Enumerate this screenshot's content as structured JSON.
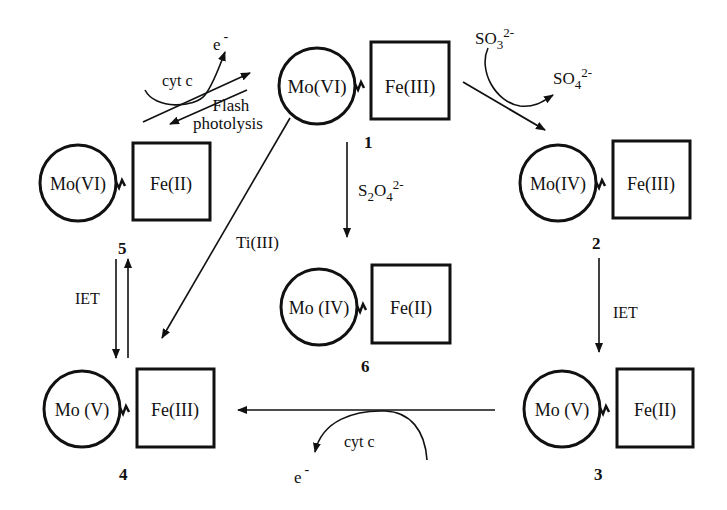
{
  "species": [
    {
      "id": "1",
      "mo": "Mo(VI)",
      "fe": "Fe(III)",
      "number": "1"
    },
    {
      "id": "2",
      "mo": "Mo(IV)",
      "fe": "Fe(III)",
      "number": "2"
    },
    {
      "id": "3",
      "mo": "Mo (V)",
      "fe": "Fe(II)",
      "number": "3"
    },
    {
      "id": "4",
      "mo": "Mo (V)",
      "fe": "Fe(III)",
      "number": "4"
    },
    {
      "id": "5",
      "mo": "Mo(VI)",
      "fe": "Fe(II)",
      "number": "5"
    },
    {
      "id": "6",
      "mo": "Mo (IV)",
      "fe": "Fe(II)",
      "number": "6"
    }
  ],
  "labels": {
    "sulfite": "SO",
    "sulfite_sub": "3",
    "sulfite_sup": "2-",
    "sulfate": "SO",
    "sulfate_sub": "4",
    "sulfate_sup": "2-",
    "dithionite": "S",
    "dithionite_sub1": "2",
    "dithionite_mid": "O",
    "dithionite_sub2": "4",
    "dithionite_sup": "2-",
    "iet_right": "IET",
    "iet_left": "IET",
    "ti": "Ti(III)",
    "cyt_top": "cyt  c",
    "cyt_bottom": "cyt  c",
    "electron": "e",
    "electron_sup": "-",
    "flash_line1": "Flash",
    "flash_line2": "photolysis"
  }
}
